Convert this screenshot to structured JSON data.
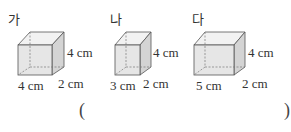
{
  "figures": [
    {
      "label": "가",
      "width": "4 cm",
      "depth": "2 cm",
      "height": "4 cm"
    },
    {
      "label": "나",
      "width": "3 cm",
      "depth": "2 cm",
      "height": "4 cm"
    },
    {
      "label": "다",
      "width": "5 cm",
      "depth": "2 cm",
      "height": "4 cm"
    }
  ],
  "answer": {
    "open": "(",
    "close": ")",
    "value": ""
  },
  "colors": {
    "front_face": "#e6e6e6",
    "side_face": "#d4d4d4",
    "top_face": "#f2f2f2",
    "edge": "#555555",
    "hidden_edge": "#777777"
  }
}
